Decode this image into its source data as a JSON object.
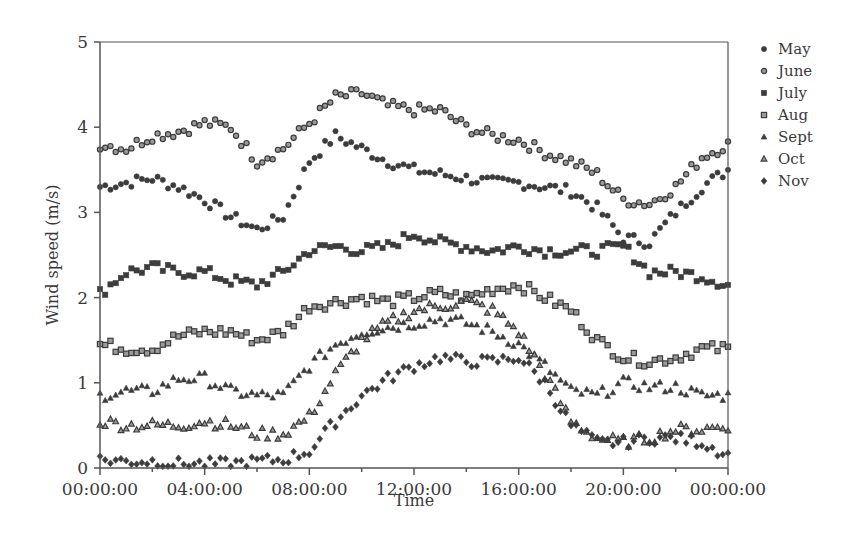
{
  "chart_data": {
    "type": "scatter",
    "title": "",
    "xlabel": "Time",
    "ylabel": "Wind speed (m/s)",
    "x_tick_labels": [
      "00:00:00",
      "04:00:00",
      "08:00:00",
      "12:00:00",
      "16:00:00",
      "20:00:00",
      "00:00:00"
    ],
    "y_tick_labels": [
      "0",
      "1",
      "2",
      "3",
      "4",
      "5"
    ],
    "ylim": [
      0,
      5
    ],
    "xlim_hours": [
      0,
      24
    ],
    "grid": false,
    "legend_position": "right",
    "x_hours": [
      0,
      1,
      2,
      3,
      4,
      5,
      6,
      7,
      8,
      9,
      10,
      11,
      12,
      13,
      14,
      15,
      16,
      17,
      18,
      19,
      20,
      21,
      22,
      23,
      24
    ],
    "series": [
      {
        "name": "May",
        "marker": "filled-circle",
        "values": [
          3.3,
          3.35,
          3.4,
          3.3,
          3.15,
          2.95,
          2.8,
          2.95,
          3.6,
          3.9,
          3.75,
          3.6,
          3.5,
          3.45,
          3.4,
          3.35,
          3.35,
          3.3,
          3.25,
          3.05,
          2.7,
          2.65,
          3.0,
          3.3,
          3.5
        ]
      },
      {
        "name": "June",
        "marker": "hollow-circle",
        "values": [
          3.8,
          3.75,
          3.9,
          3.95,
          4.05,
          4.0,
          3.6,
          3.75,
          4.05,
          4.35,
          4.4,
          4.25,
          4.2,
          4.2,
          4.0,
          3.9,
          3.85,
          3.7,
          3.6,
          3.45,
          3.15,
          3.1,
          3.3,
          3.65,
          3.8
        ]
      },
      {
        "name": "July",
        "marker": "filled-square",
        "values": [
          2.05,
          2.3,
          2.35,
          2.3,
          2.3,
          2.2,
          2.15,
          2.3,
          2.55,
          2.6,
          2.55,
          2.6,
          2.75,
          2.65,
          2.6,
          2.55,
          2.6,
          2.55,
          2.55,
          2.55,
          2.6,
          2.3,
          2.3,
          2.25,
          2.15
        ]
      },
      {
        "name": "Aug",
        "marker": "hollow-square",
        "values": [
          1.45,
          1.4,
          1.4,
          1.55,
          1.6,
          1.6,
          1.5,
          1.6,
          1.9,
          1.95,
          2.0,
          1.95,
          2.0,
          2.05,
          2.0,
          2.1,
          2.15,
          2.0,
          1.85,
          1.5,
          1.3,
          1.25,
          1.3,
          1.4,
          1.4
        ]
      },
      {
        "name": "Sept",
        "marker": "filled-triangle",
        "values": [
          0.85,
          0.9,
          0.9,
          1.05,
          1.05,
          0.9,
          0.85,
          0.85,
          1.2,
          1.45,
          1.6,
          1.65,
          1.7,
          1.75,
          1.7,
          1.6,
          1.45,
          1.2,
          0.9,
          0.85,
          1.0,
          0.95,
          0.95,
          0.85,
          0.85
        ]
      },
      {
        "name": "Oct",
        "marker": "hollow-triangle",
        "values": [
          0.55,
          0.5,
          0.5,
          0.5,
          0.55,
          0.5,
          0.4,
          0.4,
          0.6,
          1.1,
          1.5,
          1.7,
          1.85,
          1.9,
          1.95,
          1.85,
          1.6,
          1.1,
          0.55,
          0.35,
          0.3,
          0.35,
          0.45,
          0.45,
          0.5
        ]
      },
      {
        "name": "Nov",
        "marker": "filled-diamond",
        "values": [
          0.1,
          0.08,
          0.08,
          0.05,
          0.05,
          0.05,
          0.08,
          0.1,
          0.2,
          0.55,
          0.85,
          1.05,
          1.2,
          1.3,
          1.25,
          1.25,
          1.3,
          1.0,
          0.5,
          0.3,
          0.3,
          0.35,
          0.35,
          0.3,
          0.15
        ]
      }
    ]
  },
  "colors": {
    "marker": "#3c3c3c",
    "marker_hollow_fill": "#9a9a9a",
    "axis": "#555555",
    "text": "#3a3a3a"
  }
}
